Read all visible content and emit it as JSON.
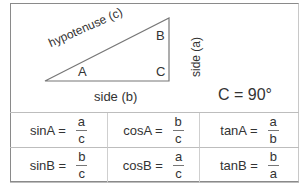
{
  "diagram": {
    "hypotenuse_label": "hypotenuse (c)",
    "side_a_label": "side (a)",
    "side_b_label": "side (b)",
    "vertex_a": "A",
    "vertex_b": "B",
    "vertex_c": "C",
    "right_angle_note": "C = 90°"
  },
  "table": {
    "rows": [
      [
        {
          "fn": "sinA =",
          "num": "a",
          "den": "c"
        },
        {
          "fn": "cosA =",
          "num": "b",
          "den": "c"
        },
        {
          "fn": "tanA =",
          "num": "a",
          "den": "b"
        }
      ],
      [
        {
          "fn": "sinB =",
          "num": "b",
          "den": "c"
        },
        {
          "fn": "cosB =",
          "num": "a",
          "den": "c"
        },
        {
          "fn": "tanB =",
          "num": "b",
          "den": "a"
        }
      ]
    ]
  }
}
